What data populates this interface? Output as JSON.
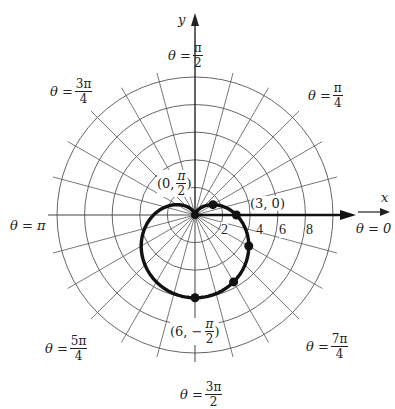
{
  "chart_data": {
    "type": "polar",
    "title": "",
    "curve": {
      "equation": "r = 3 - 3 sin(theta)",
      "name": "cardioid"
    },
    "grid": {
      "circles": [
        2,
        4,
        6,
        8,
        10
      ],
      "radial_step_deg": 15
    },
    "axis_labels": {
      "x": "x",
      "y": "y"
    },
    "radial_tick_labels": [
      "2",
      "4",
      "6",
      "8"
    ],
    "angle_labels": [
      {
        "id": "pi_over_2",
        "prefix": "θ =",
        "num": "π",
        "den": "2"
      },
      {
        "id": "3pi_over_4",
        "prefix": "θ =",
        "num": "3π",
        "den": "4"
      },
      {
        "id": "pi_over_4",
        "prefix": "θ =",
        "num": "π",
        "den": "4"
      },
      {
        "id": "pi",
        "prefix": "θ = π",
        "num": "",
        "den": ""
      },
      {
        "id": "zero",
        "prefix": "θ = 0",
        "num": "",
        "den": ""
      },
      {
        "id": "5pi_over_4",
        "prefix": "θ =",
        "num": "5π",
        "den": "4"
      },
      {
        "id": "7pi_over_4",
        "prefix": "θ =",
        "num": "7π",
        "den": "4"
      },
      {
        "id": "3pi_over_2",
        "prefix": "θ =",
        "num": "3π",
        "den": "2"
      }
    ],
    "point_labels": [
      {
        "id": "p1",
        "text_pre": "(0, ",
        "num": "π",
        "den": "2",
        "text_post": ")"
      },
      {
        "id": "p2",
        "text_pre": "(3, 0)",
        "num": "",
        "den": "",
        "text_post": ""
      },
      {
        "id": "p3",
        "text_pre": "(6, −",
        "num": "π",
        "den": "2",
        "text_post": ")"
      }
    ],
    "highlighted_points_theta_deg": [
      30,
      0,
      -30,
      -60,
      -90
    ]
  }
}
